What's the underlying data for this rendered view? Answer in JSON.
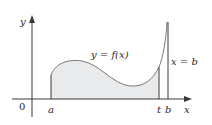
{
  "diagram": {
    "type": "improper-integral-area",
    "axes": {
      "y_label": "y",
      "x_label": "x",
      "origin_label": "0"
    },
    "x_ticks": [
      {
        "name": "a",
        "label": "a"
      },
      {
        "name": "t",
        "label": "t"
      },
      {
        "name": "b",
        "label": "b"
      }
    ],
    "curve_label": "y = f(x)",
    "asymptote_label": "x = b",
    "colors": {
      "axis": "#3a3a3a",
      "curve": "#7a7a7a",
      "shaded_region": "#e9eaec",
      "text": "#2a2a2a"
    }
  }
}
